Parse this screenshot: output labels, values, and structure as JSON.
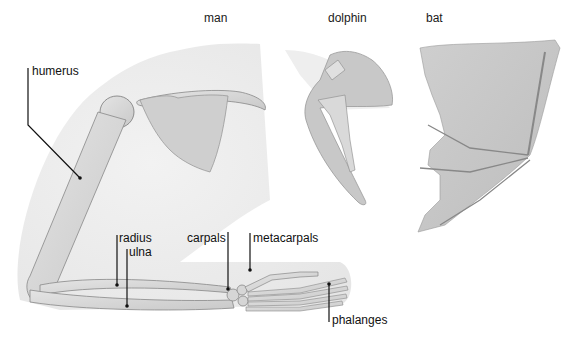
{
  "titles": {
    "man": "man",
    "dolphin": "dolphin",
    "bat": "bat"
  },
  "labels": {
    "humerus": "humerus",
    "radius": "radius",
    "ulna": "ulna",
    "carpals": "carpals",
    "metacarpals": "metacarpals",
    "phalanges": "phalanges"
  },
  "colors": {
    "bone": "#d9d9d9",
    "bone_outline": "#8c8c8c",
    "skin_shadow": "#ececec",
    "membrane": "#c4c4c4",
    "leader_line": "#111111"
  }
}
